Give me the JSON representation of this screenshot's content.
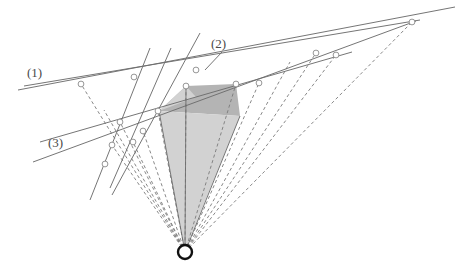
{
  "figure": {
    "background_color": "#ffffff",
    "width": 459,
    "height": 274,
    "labels": [
      {
        "id": "label-1",
        "text": "(1)",
        "x": 27,
        "y": 77
      },
      {
        "id": "label-2",
        "text": "(2)",
        "x": 211,
        "y": 48
      },
      {
        "id": "label-3",
        "text": "(3)",
        "x": 48,
        "y": 147
      }
    ],
    "colors": {
      "solid_line": "#6e6e6e",
      "dashed_line": "#7b7b7b",
      "node_stroke": "#8a8a8a",
      "node_fill": "#ffffff",
      "apex_stroke": "#111111",
      "polygon_dark": "#b4b4b4",
      "polygon_light": "#d2d2d2",
      "label_text": "#4a4a4a"
    },
    "apex": {
      "id": "apex-node",
      "x": 185,
      "y": 252,
      "outer_r": 7,
      "inner_r": 4
    },
    "nodes": [
      {
        "id": "node-a",
        "x": 81,
        "y": 84
      },
      {
        "id": "node-b",
        "x": 134,
        "y": 77
      },
      {
        "id": "node-c",
        "x": 196,
        "y": 70
      },
      {
        "id": "node-d",
        "x": 316,
        "y": 53
      },
      {
        "id": "node-e",
        "x": 336,
        "y": 55
      },
      {
        "id": "node-f",
        "x": 412,
        "y": 22
      },
      {
        "id": "node-g",
        "x": 186,
        "y": 86
      },
      {
        "id": "node-h",
        "x": 236,
        "y": 84
      },
      {
        "id": "node-i",
        "x": 158,
        "y": 111
      },
      {
        "id": "node-j",
        "x": 120,
        "y": 122
      },
      {
        "id": "node-k",
        "x": 133,
        "y": 142
      },
      {
        "id": "node-l",
        "x": 112,
        "y": 145
      },
      {
        "id": "node-m",
        "x": 105,
        "y": 164
      },
      {
        "id": "node-n",
        "x": 259,
        "y": 83
      },
      {
        "id": "node-o",
        "x": 143,
        "y": 131
      }
    ],
    "solid_lines": [
      {
        "id": "line-1-upper",
        "x1": 18,
        "y1": 90,
        "x2": 455,
        "y2": 7
      },
      {
        "id": "line-1-lower",
        "x1": 24,
        "y1": 86,
        "x2": 420,
        "y2": 20
      },
      {
        "id": "line-3-long",
        "x1": 33,
        "y1": 162,
        "x2": 416,
        "y2": 21
      },
      {
        "id": "line-3-second",
        "x1": 40,
        "y1": 142,
        "x2": 352,
        "y2": 52
      },
      {
        "id": "line-steep-a",
        "x1": 150,
        "y1": 48,
        "x2": 90,
        "y2": 200
      },
      {
        "id": "line-steep-b",
        "x1": 200,
        "y1": 33,
        "x2": 112,
        "y2": 195
      },
      {
        "id": "line-steep-c",
        "x1": 110,
        "y1": 188,
        "x2": 171,
        "y2": 48
      },
      {
        "id": "leader-2",
        "x1": 205,
        "y1": 70,
        "x2": 222,
        "y2": 52
      }
    ],
    "dashed_rays": [
      {
        "id": "ray-1",
        "x2": 81,
        "y2": 84
      },
      {
        "id": "ray-2",
        "x2": 104,
        "y2": 110
      },
      {
        "id": "ray-3",
        "x2": 112,
        "y2": 145
      },
      {
        "id": "ray-4",
        "x2": 120,
        "y2": 122
      },
      {
        "id": "ray-5",
        "x2": 133,
        "y2": 142
      },
      {
        "id": "ray-6",
        "x2": 143,
        "y2": 131
      },
      {
        "id": "ray-7",
        "x2": 158,
        "y2": 111
      },
      {
        "id": "ray-8",
        "x2": 186,
        "y2": 86
      },
      {
        "id": "ray-9",
        "x2": 236,
        "y2": 84
      },
      {
        "id": "ray-10",
        "x2": 259,
        "y2": 83
      },
      {
        "id": "ray-11",
        "x2": 290,
        "y2": 62
      },
      {
        "id": "ray-12",
        "x2": 316,
        "y2": 53
      },
      {
        "id": "ray-13",
        "x2": 336,
        "y2": 55
      },
      {
        "id": "ray-14",
        "x2": 412,
        "y2": 22
      }
    ],
    "polygons": [
      {
        "id": "polygon-dark-upper",
        "shade": "dark",
        "points": "186,86 236,84 240,116 159,111"
      },
      {
        "id": "polygon-light-cone",
        "shade": "light",
        "points": "159,111 240,116 185,250"
      },
      {
        "id": "polygon-light-upper-left",
        "shade": "light",
        "points": "159,111 186,86 196,97"
      }
    ]
  }
}
